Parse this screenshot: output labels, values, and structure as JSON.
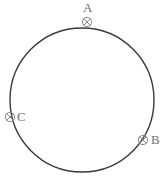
{
  "diagram": {
    "type": "geometry-figure",
    "background_color": "#ffffff",
    "stroke_color": "#3a3a3a",
    "label_color": "#6f6f6f",
    "marker_color": "#8a8a8a",
    "canvas": {
      "width": 168,
      "height": 189
    },
    "circle": {
      "name": "main-circle",
      "center_x": 82,
      "center_y": 100,
      "radius": 72,
      "stroke_width": 1.4,
      "fill": "none"
    },
    "points": [
      {
        "id": "A",
        "label": "A",
        "marker": "circle-x-marker",
        "marker_x": 87,
        "marker_y": 22,
        "marker_radius": 5,
        "label_x": 83,
        "label_y": 1,
        "position_description": "top of circle"
      },
      {
        "id": "B",
        "label": "B",
        "marker": "circle-x-marker",
        "marker_x": 143,
        "marker_y": 140,
        "marker_radius": 5,
        "label_x": 151,
        "label_y": 133,
        "position_description": "lower right of circle"
      },
      {
        "id": "C",
        "label": "C",
        "marker": "circle-x-marker",
        "marker_x": 10,
        "marker_y": 117,
        "marker_radius": 5,
        "label_x": 17,
        "label_y": 110,
        "position_description": "left of circle"
      }
    ]
  }
}
